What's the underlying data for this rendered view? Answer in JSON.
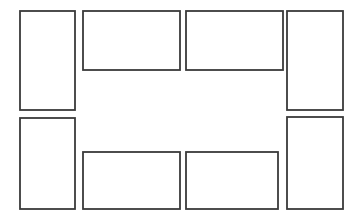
{
  "document": {
    "title": "Rectangle Layout Diagram",
    "description": "Line drawing of eight outlined rectangles arranged around an open central area",
    "canvas": {
      "width": 362,
      "height": 223,
      "background_color": "#ffffff"
    },
    "style": {
      "stroke_color": "#3a3a3a",
      "stroke_width": 1.8,
      "fill_color": "#ffffff",
      "line_join": "miter"
    }
  },
  "shapes": [
    {
      "id": "rect-top-left-tall",
      "label": "top-left vertical rectangle",
      "orientation": "portrait",
      "x": 20,
      "y": 11,
      "width": 55,
      "height": 99
    },
    {
      "id": "rect-top-middle-left-wide",
      "label": "top inner-left horizontal rectangle",
      "orientation": "landscape",
      "x": 83,
      "y": 11,
      "width": 97,
      "height": 59
    },
    {
      "id": "rect-top-middle-right-wide",
      "label": "top inner-right horizontal rectangle",
      "orientation": "landscape",
      "x": 186,
      "y": 11,
      "width": 97,
      "height": 59
    },
    {
      "id": "rect-top-right-tall",
      "label": "top-right vertical rectangle",
      "orientation": "portrait",
      "x": 287,
      "y": 11,
      "width": 56,
      "height": 99
    },
    {
      "id": "rect-bottom-left-tall",
      "label": "bottom-left vertical rectangle",
      "orientation": "portrait",
      "x": 20,
      "y": 118,
      "width": 55,
      "height": 91
    },
    {
      "id": "rect-bottom-middle-left-wide",
      "label": "bottom inner-left horizontal rectangle",
      "orientation": "landscape",
      "x": 83,
      "y": 152,
      "width": 97,
      "height": 57
    },
    {
      "id": "rect-bottom-middle-right-wide",
      "label": "bottom inner-right horizontal rectangle",
      "orientation": "landscape",
      "x": 186,
      "y": 152,
      "width": 92,
      "height": 57
    },
    {
      "id": "rect-bottom-right-tall",
      "label": "bottom-right vertical rectangle",
      "orientation": "portrait",
      "x": 287,
      "y": 117,
      "width": 56,
      "height": 92
    }
  ],
  "counts": {
    "total_shapes": 8,
    "portrait_shapes": 4,
    "landscape_shapes": 4
  }
}
